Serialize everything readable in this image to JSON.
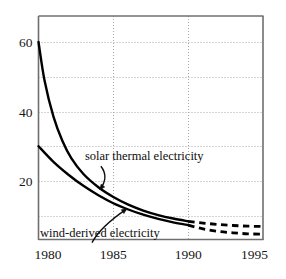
{
  "chart_data": {
    "type": "line",
    "title": "",
    "subtitle": "",
    "xlabel": "",
    "ylabel": "",
    "xlim": [
      1980,
      1995
    ],
    "ylim": [
      0,
      65
    ],
    "grid": true,
    "grid_x_values": [
      1980,
      1985,
      1990,
      1995
    ],
    "grid_y_values": [
      10,
      20,
      30,
      40,
      50,
      60
    ],
    "xticks": [
      1980,
      1985,
      1990,
      1995
    ],
    "xtick_labels": [
      "1980",
      "1985",
      "1990",
      "1995"
    ],
    "yticks": [
      20,
      40,
      60
    ],
    "ytick_labels": [
      "20",
      "40",
      "60"
    ],
    "legend_position": "inline-annotations",
    "series": [
      {
        "name": "solar thermal electricity",
        "label": "solar thermal electricity",
        "style": "solid-then-dashed",
        "solid_x": [
          1980,
          1980.4,
          1981,
          1981.6,
          1982.2,
          1983,
          1984,
          1985,
          1986,
          1987,
          1988,
          1989,
          1990
        ],
        "solid_values": [
          60,
          49,
          38.5,
          31.5,
          26.5,
          22,
          18.2,
          15.4,
          13.2,
          11.5,
          10.2,
          9.2,
          8.4
        ],
        "dashed_x": [
          1990,
          1991,
          1992,
          1993,
          1994,
          1995
        ],
        "dashed_values": [
          8.4,
          7.9,
          7.5,
          7.2,
          7.0,
          6.9
        ]
      },
      {
        "name": "wind-derived electricity",
        "label": "wind-derived electricity",
        "style": "solid-then-dashed",
        "solid_x": [
          1980,
          1981,
          1982,
          1983,
          1984,
          1985,
          1986,
          1987,
          1988,
          1989,
          1990
        ],
        "solid_values": [
          30,
          25.5,
          21.8,
          18.6,
          15.9,
          13.6,
          11.8,
          10.3,
          9.1,
          8.1,
          7.3
        ],
        "dashed_x": [
          1990,
          1991,
          1992,
          1993,
          1994,
          1995
        ],
        "dashed_values": [
          7.3,
          6.2,
          5.5,
          5.1,
          4.8,
          4.7
        ]
      }
    ],
    "annotations": [
      {
        "text": "solar thermal electricity",
        "x": 1983.1,
        "y": 26.0,
        "arrow_to_x": 1984.1,
        "arrow_to_y": 17.5
      },
      {
        "text": "wind-derived electricity",
        "x": 1980.1,
        "y": 4.0,
        "arrow_to_x": 1985.9,
        "arrow_to_y": 12.0
      }
    ]
  },
  "style": {
    "frame_color": "#6f6f6f",
    "grid_color": "#a8a8a8",
    "curve_color": "#000000",
    "text_color": "#161616",
    "background": "#ffffff"
  }
}
